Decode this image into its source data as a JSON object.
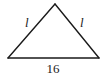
{
  "diagram": {
    "type": "isosceles-triangle",
    "labels": {
      "left_side": "l",
      "right_side": "l",
      "base": "16"
    },
    "colors": {
      "stroke": "#1a1a1a",
      "text": "#222222",
      "background": "#ffffff"
    }
  }
}
